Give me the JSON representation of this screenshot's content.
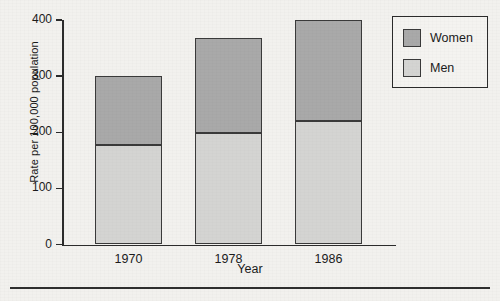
{
  "chart_data": {
    "type": "bar",
    "subtype": "stacked-vertical",
    "title": "",
    "xlabel": "Year",
    "ylabel": "Rate per 100,000 population",
    "categories": [
      "1970",
      "1978",
      "1986"
    ],
    "series": [
      {
        "name": "Men",
        "values": [
          178,
          198,
          220
        ],
        "color": "#d4d4d2"
      },
      {
        "name": "Women",
        "values": [
          122,
          170,
          180
        ],
        "color": "#a9a9a9"
      }
    ],
    "totals": [
      300,
      368,
      400
    ],
    "ylim": [
      0,
      400
    ],
    "yticks": [
      0,
      100,
      200,
      300,
      400
    ],
    "ytick_labels": [
      "0",
      "100",
      "200",
      "300",
      "400"
    ],
    "grid": false,
    "legend_position": "top-right",
    "legend_entries": [
      "Women",
      "Men"
    ]
  },
  "axes": {
    "y_title": "Rate per 100,000 population",
    "x_title": "Year"
  },
  "legend": {
    "items": [
      {
        "label": "Women"
      },
      {
        "label": "Men"
      }
    ]
  },
  "colors": {
    "women": "#a9a9a9",
    "men": "#d4d4d2",
    "outline": "#3a3a3a",
    "axis": "#2b2b2b",
    "background": "#f2f1ee"
  }
}
